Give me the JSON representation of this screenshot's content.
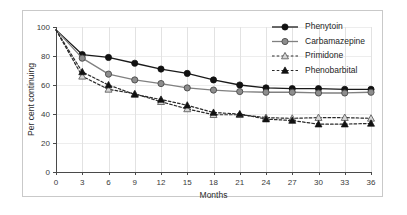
{
  "chart_data": {
    "type": "line",
    "title": "",
    "xlabel": "Months",
    "ylabel": "Per cent continuing",
    "xlim": [
      0,
      36
    ],
    "ylim": [
      0,
      100
    ],
    "x": [
      0,
      3,
      6,
      9,
      12,
      15,
      18,
      21,
      24,
      27,
      30,
      33,
      36
    ],
    "xticks": [
      "0",
      "3",
      "6",
      "9",
      "12",
      "15",
      "18",
      "21",
      "24",
      "27",
      "30",
      "33",
      "36"
    ],
    "yticks": [
      "0",
      "20",
      "40",
      "60",
      "80",
      "100"
    ],
    "grid": "both",
    "legend_position": "top-right",
    "series": [
      {
        "name": "Phenytoin",
        "values": [
          98,
          81,
          79,
          75,
          71,
          68,
          63.5,
          60,
          58,
          57.5,
          57.5,
          57,
          57
        ],
        "color": "#1a1a1a",
        "marker": "filled-circle",
        "line_style": "solid"
      },
      {
        "name": "Carbamazepine",
        "values": [
          98,
          78.5,
          67.5,
          63.5,
          61,
          58,
          56.5,
          55.5,
          55,
          55,
          54.5,
          54.5,
          55
        ],
        "color": "#808080",
        "marker": "gray-circle",
        "line_style": "solid"
      },
      {
        "name": "Primidone",
        "values": [
          98,
          66,
          57,
          54,
          48.5,
          43.5,
          39.5,
          39.5,
          37.5,
          37,
          37.5,
          37.5,
          37
        ],
        "color": "#9a9a9a",
        "marker": "open-triangle",
        "line_style": "dashed"
      },
      {
        "name": "Phenobarbital",
        "values": [
          98,
          69,
          60,
          53.5,
          50,
          46,
          41,
          40,
          36.5,
          35.5,
          33,
          33,
          33.5
        ],
        "color": "#1a1a1a",
        "marker": "filled-triangle",
        "line_style": "dashed"
      }
    ]
  },
  "figure": {
    "background_color": "#ffffff",
    "border_color": "#c9c9c9",
    "grid_color": "#e2e2e2",
    "axis_color": "#4a4a4a"
  }
}
